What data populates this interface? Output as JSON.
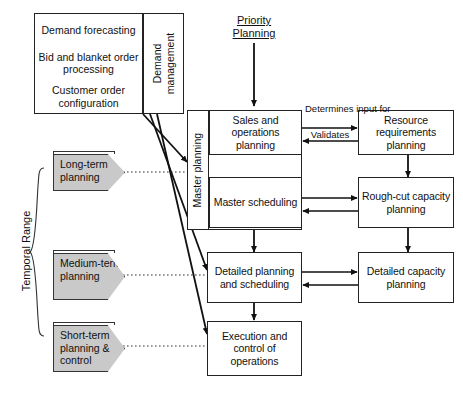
{
  "diagram": {
    "type": "flowchart",
    "colors": {
      "chevron_fill": "#c9c9c9",
      "box_fill": "#ffffff",
      "stroke": "#222222"
    },
    "demand_management": {
      "group_label": "Demand management",
      "cells": [
        {
          "label": "Demand forecasting"
        },
        {
          "label": "Bid and blanket order processing"
        },
        {
          "label": "Customer order configuration"
        }
      ]
    },
    "priority_planning_label": "Priority Planning",
    "master_planning_label": "Master planning",
    "temporal_range_label": "Temporal Range",
    "temporal_chevrons": [
      {
        "label": "Long-term planning"
      },
      {
        "label": "Medium-term planning"
      },
      {
        "label": "Short-term planning & control"
      }
    ],
    "priority_boxes": [
      {
        "label": "Sales and operations planning"
      },
      {
        "label": "Master scheduling"
      },
      {
        "label": "Detailed planning and scheduling"
      },
      {
        "label": "Execution and control of operations"
      }
    ],
    "capacity_boxes": [
      {
        "label": "Resource requirements planning"
      },
      {
        "label": "Rough-cut capacity planning"
      },
      {
        "label": "Detailed capacity planning"
      }
    ],
    "edge_labels": {
      "determines": "Determines input for",
      "validates": "Validates"
    }
  }
}
